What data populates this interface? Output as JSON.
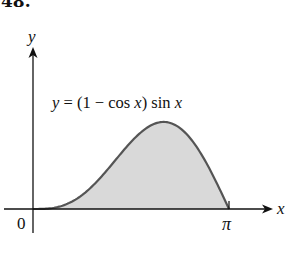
{
  "problem_number": "48.",
  "chart_data": {
    "type": "area",
    "title": "",
    "equation_label": "y = (1 − cos x) sin x",
    "function": "(1 - cos x) sin x",
    "xlabel": "x",
    "ylabel": "y",
    "x_ticks": [
      {
        "value": 0,
        "label": "0"
      },
      {
        "value": 3.14159,
        "label": "π"
      }
    ],
    "xlim": [
      0,
      3.14159
    ],
    "ylim": [
      0,
      1.3
    ],
    "grid": false,
    "legend": "none",
    "fill_color": "#d9d9d9",
    "line_color": "#555555",
    "x": [
      0,
      0.3927,
      0.7854,
      1.1781,
      1.5708,
      1.9635,
      2.0944,
      2.3562,
      2.7489,
      3.14159
    ],
    "values": [
      0,
      0.0293,
      0.2071,
      0.5307,
      1.0,
      1.2584,
      1.299,
      1.2071,
      0.7071,
      0
    ]
  }
}
